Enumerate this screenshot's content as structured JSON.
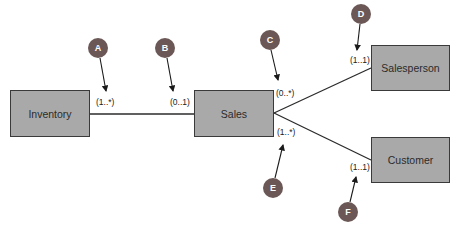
{
  "diagram": {
    "type": "uml-class-association",
    "colors": {
      "entity_fill": "#a9a9a9",
      "entity_border": "#3a3a3a",
      "marker_fill": "#6b5856",
      "line": "#2b2b2b"
    },
    "entities": [
      {
        "id": "inventory",
        "label": "Inventory"
      },
      {
        "id": "sales",
        "label": "Sales"
      },
      {
        "id": "salesperson",
        "label": "Salesperson"
      },
      {
        "id": "customer",
        "label": "Customer"
      }
    ],
    "associations": [
      {
        "from": "inventory",
        "to": "sales",
        "from_multiplicity": "(1..*)",
        "to_multiplicity": "(0..1)"
      },
      {
        "from": "sales",
        "to": "salesperson",
        "from_multiplicity": "(0..*)",
        "to_multiplicity": "(1..1)"
      },
      {
        "from": "sales",
        "to": "customer",
        "from_multiplicity": "(1..*)",
        "to_multiplicity": "(1..1)"
      }
    ],
    "multiplicities": {
      "a": "(1..*)",
      "b": "(0..1)",
      "c": "(0..*)",
      "d": "(1..1)",
      "e": "(1..*)",
      "f": "(1..1)"
    },
    "markers": {
      "a": "A",
      "b": "B",
      "c": "C",
      "d": "D",
      "e": "E",
      "f": "F"
    }
  }
}
